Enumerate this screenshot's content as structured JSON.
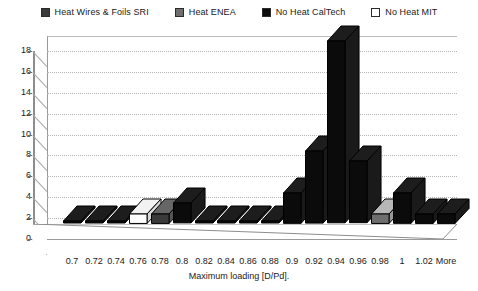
{
  "legend": {
    "position": "top",
    "items": [
      {
        "label": "Heat Wires & Foils SRI",
        "color": "#3a3a3a",
        "key": "sri"
      },
      {
        "label": "Heat ENEA",
        "color": "#6e6e6e",
        "key": "enea"
      },
      {
        "label": "No Heat CalTech",
        "color": "#0b0b0b",
        "key": "caltech"
      },
      {
        "label": "No Heat MIT",
        "color": "#ffffff",
        "key": "mit"
      }
    ]
  },
  "chart_data": {
    "type": "bar",
    "title": "",
    "subtitle": "",
    "xlabel": "Maximum loading [D/Pd].",
    "ylabel": "",
    "grid": true,
    "three_d": true,
    "ylim": [
      0,
      18
    ],
    "ytick_step": 2,
    "yticks": [
      "0",
      "2",
      "4",
      "6",
      "8",
      "10",
      "12",
      "14",
      "16",
      "18"
    ],
    "categories": [
      "0.7",
      "0.72",
      "0.74",
      "0.76",
      "0.78",
      "0.8",
      "0.82",
      "0.84",
      "0.86",
      "0.88",
      "0.9",
      "0.92",
      "0.94",
      "0.96",
      "0.98",
      "1",
      "1.02",
      "More"
    ],
    "values": [
      0,
      0,
      0,
      1,
      1,
      2,
      0,
      0,
      0,
      0,
      3,
      7,
      17.5,
      6,
      1,
      3,
      1,
      1
    ],
    "series_key": [
      "caltech",
      "caltech",
      "caltech",
      "mit",
      "sri",
      "caltech",
      "caltech",
      "caltech",
      "caltech",
      "caltech",
      "caltech",
      "caltech",
      "caltech",
      "caltech",
      "enea",
      "caltech",
      "caltech",
      "caltech"
    ],
    "bar_colors": [
      "#0b0b0b",
      "#0b0b0b",
      "#0b0b0b",
      "#ffffff",
      "#3a3a3a",
      "#0b0b0b",
      "#0b0b0b",
      "#0b0b0b",
      "#0b0b0b",
      "#0b0b0b",
      "#0b0b0b",
      "#0b0b0b",
      "#0b0b0b",
      "#0b0b0b",
      "#6e6e6e",
      "#0b0b0b",
      "#0b0b0b",
      "#0b0b0b"
    ],
    "legend_entries": [
      "Heat Wires & Foils SRI",
      "Heat ENEA",
      "No Heat CalTech",
      "No Heat MIT"
    ]
  },
  "colors": {
    "background": "#ffffff",
    "axis": "#8d8d8d",
    "grid": "#b5b5b5",
    "text": "#1a1a1a"
  }
}
